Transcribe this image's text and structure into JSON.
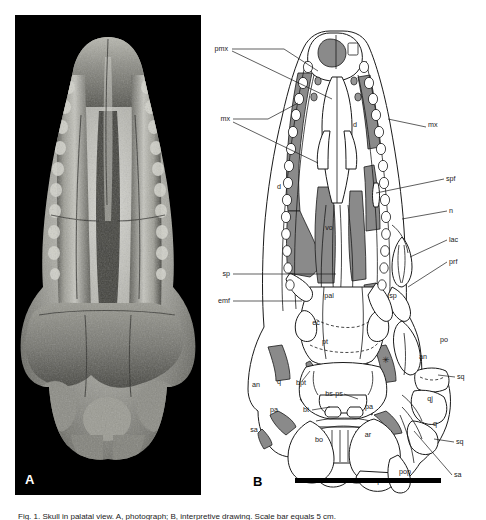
{
  "figure": {
    "panel_a": {
      "letter": "A",
      "caption_alt": "Photograph of fossil skull in palatal (ventral) view"
    },
    "panel_b": {
      "letter": "B",
      "caption_alt": "Interpretive line drawing of the same skull in palatal view",
      "scale_bar": true
    },
    "caption_line": "Fig. 1.  Skull in palatal view. A, photograph; B, interpretive drawing. Scale bar equals 5 cm."
  },
  "colors": {
    "ink": "#1a1a1a",
    "matrix_fill": "#8a8a8a",
    "bone_fill": "#ffffff",
    "photo_bg": "#000000",
    "scale_bar": "#000000"
  },
  "labels": [
    {
      "id": "pmx",
      "text": "pmx",
      "x": 22,
      "y": 36,
      "anchor": "end",
      "type": "leader"
    },
    {
      "id": "mx-l",
      "text": "mx",
      "x": 24,
      "y": 106,
      "anchor": "end",
      "type": "leader"
    },
    {
      "id": "mx-r",
      "text": "mx",
      "x": 222,
      "y": 112,
      "anchor": "start",
      "type": "leader"
    },
    {
      "id": "spf",
      "text": "spf",
      "x": 240,
      "y": 166,
      "anchor": "start",
      "type": "leader"
    },
    {
      "id": "n",
      "text": "n",
      "x": 243,
      "y": 198,
      "anchor": "start",
      "type": "leader"
    },
    {
      "id": "lac",
      "text": "lac",
      "x": 243,
      "y": 227,
      "anchor": "start",
      "type": "leader"
    },
    {
      "id": "prf",
      "text": "prf",
      "x": 243,
      "y": 249,
      "anchor": "start",
      "type": "leader"
    },
    {
      "id": "sp-l",
      "text": "sp",
      "x": 24,
      "y": 261,
      "anchor": "end",
      "type": "leader"
    },
    {
      "id": "emf",
      "text": "emf",
      "x": 24,
      "y": 288,
      "anchor": "end",
      "type": "leader"
    },
    {
      "id": "d-up",
      "text": "d",
      "x": 149,
      "y": 112,
      "anchor": "middle",
      "type": "inline"
    },
    {
      "id": "d-lo",
      "text": "d",
      "x": 73,
      "y": 174,
      "anchor": "middle",
      "type": "inline"
    },
    {
      "id": "vo",
      "text": "vo",
      "x": 123,
      "y": 215,
      "anchor": "middle",
      "type": "inline"
    },
    {
      "id": "pal",
      "text": "pal",
      "x": 123,
      "y": 283,
      "anchor": "middle",
      "type": "inline"
    },
    {
      "id": "ec",
      "text": "ec",
      "x": 110,
      "y": 310,
      "anchor": "middle",
      "type": "inline"
    },
    {
      "id": "pt",
      "text": "pt",
      "x": 119,
      "y": 329,
      "anchor": "middle",
      "type": "inline"
    },
    {
      "id": "sp-r",
      "text": "sp",
      "x": 187,
      "y": 283,
      "anchor": "middle",
      "type": "inline"
    },
    {
      "id": "po",
      "text": "po",
      "x": 238,
      "y": 327,
      "anchor": "middle",
      "type": "inline"
    },
    {
      "id": "an-r",
      "text": "an",
      "x": 217,
      "y": 344,
      "anchor": "middle",
      "type": "inline"
    },
    {
      "id": "an-l",
      "text": "an",
      "x": 50,
      "y": 372,
      "anchor": "middle",
      "type": "inline"
    },
    {
      "id": "q-l",
      "text": "q",
      "x": 73,
      "y": 369,
      "anchor": "middle",
      "type": "inline"
    },
    {
      "id": "bpt",
      "text": "bpt",
      "x": 95,
      "y": 370,
      "anchor": "middle",
      "type": "leader"
    },
    {
      "id": "bsps",
      "text": "bs-ps",
      "x": 128,
      "y": 381,
      "anchor": "middle",
      "type": "leader"
    },
    {
      "id": "bt",
      "text": "bt",
      "x": 100,
      "y": 397,
      "anchor": "middle",
      "type": "leader"
    },
    {
      "id": "pa-l",
      "text": "pa",
      "x": 68,
      "y": 397,
      "anchor": "middle",
      "type": "inline"
    },
    {
      "id": "pa-r",
      "text": "pa",
      "x": 163,
      "y": 394,
      "anchor": "middle",
      "type": "inline"
    },
    {
      "id": "sa-l",
      "text": "sa",
      "x": 48,
      "y": 417,
      "anchor": "middle",
      "type": "inline"
    },
    {
      "id": "bo",
      "text": "bo",
      "x": 113,
      "y": 427,
      "anchor": "middle",
      "type": "inline"
    },
    {
      "id": "ar",
      "text": "ar",
      "x": 162,
      "y": 422,
      "anchor": "middle",
      "type": "inline"
    },
    {
      "id": "rap",
      "text": "rap",
      "x": 170,
      "y": 468,
      "anchor": "middle",
      "type": "inline"
    },
    {
      "id": "pop",
      "text": "pop",
      "x": 199,
      "y": 459,
      "anchor": "middle",
      "type": "inline"
    },
    {
      "id": "sq-up",
      "text": "sq",
      "x": 251,
      "y": 364,
      "anchor": "start",
      "type": "leader"
    },
    {
      "id": "qj",
      "text": "qj",
      "x": 224,
      "y": 386,
      "anchor": "middle",
      "type": "inline"
    },
    {
      "id": "q-r",
      "text": "q",
      "x": 229,
      "y": 411,
      "anchor": "middle",
      "type": "inline"
    },
    {
      "id": "sq-lo",
      "text": "sq",
      "x": 250,
      "y": 429,
      "anchor": "start",
      "type": "leader"
    },
    {
      "id": "sa-r",
      "text": "sa",
      "x": 248,
      "y": 462,
      "anchor": "start",
      "type": "leader"
    }
  ],
  "abbreviations": {
    "pmx": "premaxilla",
    "mx": "maxilla",
    "d": "dentary",
    "n": "nasal",
    "lac": "lacrimal",
    "prf": "prefrontal",
    "spf": "suborbital/supratemporal fenestra",
    "sp": "splenial",
    "emf": "external mandibular fenestra",
    "vo": "vomer",
    "pal": "palatine",
    "ec": "ectopterygoid",
    "pt": "pterygoid",
    "bpt": "basipterygoid",
    "bs-ps": "basisphenoid-parasphenoid",
    "bt": "basal tubera",
    "bo": "basioccipital",
    "po": "postorbital",
    "pa": "prearticular",
    "an": "angular",
    "sa": "surangular",
    "ar": "articular",
    "rap": "retroarticular process",
    "pop": "paroccipital process",
    "q": "quadrate",
    "qj": "quadratojugal",
    "sq": "squamosal"
  }
}
